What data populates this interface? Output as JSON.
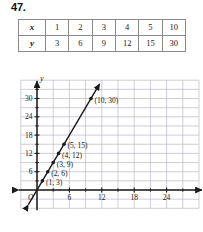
{
  "problem": {
    "number": "47."
  },
  "table": {
    "rows": [
      {
        "variable": "x",
        "values": [
          "1",
          "2",
          "3",
          "4",
          "5",
          "10"
        ]
      },
      {
        "variable": "y",
        "values": [
          "3",
          "6",
          "9",
          "12",
          "15",
          "30"
        ]
      }
    ]
  },
  "chart_data": {
    "type": "line",
    "title": "",
    "xlabel": "x",
    "ylabel": "y",
    "x": [
      1,
      2,
      3,
      4,
      5,
      10
    ],
    "y": [
      3,
      6,
      9,
      12,
      15,
      30
    ],
    "series": [
      {
        "name": "y = 3x",
        "values": [
          3,
          6,
          9,
          12,
          15,
          30
        ]
      }
    ],
    "point_labels": [
      "(1, 3)",
      "(2, 6)",
      "(3, 9)",
      "(4, 12)",
      "(5, 15)",
      "(10, 30)"
    ],
    "xlim": [
      -3,
      30
    ],
    "ylim": [
      -6,
      36
    ],
    "xticks": [
      6,
      12,
      18,
      24
    ],
    "xtick_labels": [
      "6",
      "12",
      "18",
      "24"
    ],
    "yticks": [
      6,
      12,
      18,
      24,
      30
    ],
    "ytick_labels": [
      "6",
      "12",
      "18",
      "24",
      "30"
    ],
    "origin_label": "O",
    "grid": true,
    "grid_step": 3,
    "legend": "none",
    "line_color": "#1a1a1a",
    "grid_color": "#b9b9c9",
    "axis_color": "#1a1a1a"
  }
}
